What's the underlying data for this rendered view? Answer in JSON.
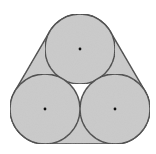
{
  "diagram": {
    "colors": {
      "background": "#ffffff",
      "fill": "#cbcbcb",
      "stroke": "#3f3f3f",
      "center_dot": "#111111",
      "gap": "#ffffff"
    },
    "radius": 35,
    "circles": [
      {
        "id": "top",
        "cx": 80,
        "cy": 49
      },
      {
        "id": "bottom-left",
        "cx": 45,
        "cy": 109
      },
      {
        "id": "bottom-right",
        "cx": 115,
        "cy": 109
      }
    ],
    "band": {
      "tangent_points": {
        "left_top": [
          49.8,
          31.4
        ],
        "left_bottom": [
          14.8,
          91.4
        ],
        "right_top": [
          110.2,
          31.4
        ],
        "right_bottom": [
          145.2,
          91.4
        ],
        "bottom_left": [
          45,
          144
        ],
        "bottom_right": [
          115,
          144
        ]
      }
    }
  }
}
